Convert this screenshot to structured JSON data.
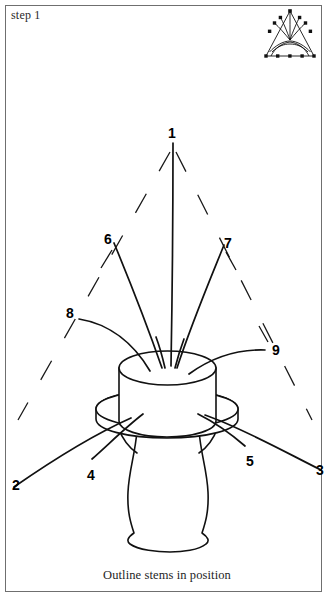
{
  "page": {
    "step_label": "step 1",
    "caption": "Outline stems in position",
    "background_color": "#ffffff",
    "frame_color": "#6f6f6f",
    "ink_color": "#111111"
  },
  "shape_icon": {
    "name": "triangle-arrangement-icon",
    "description": "small triangular arrangement thumbnail with dotted stem positions"
  },
  "labels": [
    {
      "id": "1",
      "text": "1",
      "x": 168,
      "y": 126
    },
    {
      "id": "2",
      "text": "2",
      "x": 12,
      "y": 478
    },
    {
      "id": "3",
      "text": "3",
      "x": 316,
      "y": 463
    },
    {
      "id": "4",
      "text": "4",
      "x": 87,
      "y": 468
    },
    {
      "id": "5",
      "text": "5",
      "x": 246,
      "y": 454
    },
    {
      "id": "6",
      "text": "6",
      "x": 104,
      "y": 232
    },
    {
      "id": "7",
      "text": "7",
      "x": 224,
      "y": 236
    },
    {
      "id": "8",
      "text": "8",
      "x": 66,
      "y": 306
    },
    {
      "id": "9",
      "text": "9",
      "x": 272,
      "y": 343
    }
  ],
  "diagram": {
    "type": "floral-arrangement-step-diagram",
    "stem_count": 9,
    "container": "pedestal vase with cylindrical floral foam and saucer rim",
    "guide": "dashed triangular outline"
  }
}
